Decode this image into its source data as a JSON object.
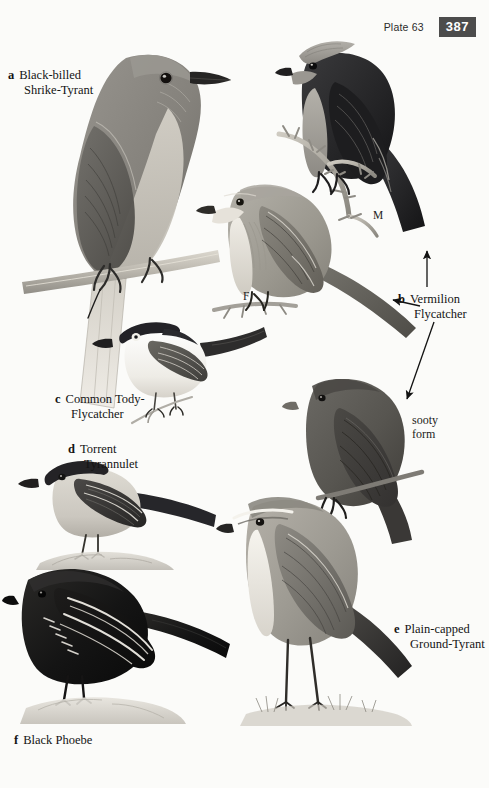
{
  "page": {
    "width": 489,
    "height": 788,
    "background_color": "#fbfbf9",
    "ink_color": "#141414"
  },
  "header": {
    "plate_label": "Plate 63",
    "page_number": "387",
    "page_number_bg": "#4c4c4c",
    "page_number_fg": "#ffffff"
  },
  "captions": [
    {
      "key": "a",
      "line1": "Black-billed",
      "line2": "Shrike-Tyrant",
      "x": 8,
      "y": 68
    },
    {
      "key": "b",
      "line1": "Vermilion",
      "line2": "Flycatcher",
      "x": 398,
      "y": 292
    },
    {
      "key": "c",
      "line1": "Common Tody-",
      "line2": "Flycatcher",
      "x": 55,
      "y": 392
    },
    {
      "key": "d",
      "line1": "Torrent",
      "line2": "Tyrannulet",
      "x": 68,
      "y": 442
    },
    {
      "key": "e",
      "line1": "Plain-capped",
      "line2": "Ground-Tyrant",
      "x": 394,
      "y": 622
    },
    {
      "key": "f",
      "line1": "Black Phoebe",
      "line2": "",
      "x": 14,
      "y": 733
    }
  ],
  "annotations": [
    {
      "name": "sooty-form",
      "line1": "sooty",
      "line2": "form",
      "x": 412,
      "y": 413
    },
    {
      "name": "male-mark",
      "text": "M",
      "x": 373,
      "y": 209
    },
    {
      "name": "female-mark",
      "text": "F",
      "x": 243,
      "y": 290
    }
  ],
  "arrows": [
    {
      "name": "arrow-up-to-male",
      "x1": 427,
      "y1": 287,
      "x2": 427,
      "y2": 250
    },
    {
      "name": "arrow-left-to-female",
      "x1": 418,
      "y1": 305,
      "x2": 392,
      "y2": 300
    },
    {
      "name": "arrow-diagonal-to-sooty",
      "x1": 432,
      "y1": 323,
      "x2": 406,
      "y2": 400
    }
  ],
  "plates": [
    {
      "name": "black-billed-shrike-tyrant",
      "common_name": "Black-billed Shrike-Tyrant",
      "key": "a",
      "pose": "perched on horizontal branch, facing right",
      "plumage": "grey-brown upperparts, pale buff underparts, black bill, long tail",
      "body_color": "#8c8a85",
      "belly_color": "#c9c5bc",
      "wing_color": "#6c6a66",
      "bill_color": "#2a2a2a"
    },
    {
      "name": "vermilion-flycatcher-male",
      "common_name": "Vermilion Flycatcher",
      "key": "b",
      "sex": "M",
      "pose": "perched on thorny branch, facing right",
      "plumage": "crested pale crown, blackish mask, back, wings and tail",
      "body_color": "#2a2a2c",
      "crown_color": "#9e9c97",
      "breast_color": "#a6a39d"
    },
    {
      "name": "vermilion-flycatcher-female",
      "common_name": "Vermilion Flycatcher",
      "key": "b",
      "sex": "F",
      "pose": "perched on small twig, facing left",
      "plumage": "grey-brown above, whitish streaked breast, dark tail",
      "body_color": "#a8a49c",
      "belly_color": "#e2ded6",
      "wing_color": "#7c7a74"
    },
    {
      "name": "vermilion-flycatcher-sooty-form",
      "common_name": "Vermilion Flycatcher",
      "key": "b",
      "form": "sooty form",
      "pose": "perched on twig, facing left",
      "plumage": "uniform dark sooty-grey overall",
      "body_color": "#55534f"
    },
    {
      "name": "common-tody-flycatcher",
      "common_name": "Common Tody-Flycatcher",
      "key": "c",
      "pose": "perched on slender twig, facing left",
      "plumage": "blackish cap, pale eye, white underparts, long dark tail",
      "cap_color": "#27262a",
      "body_color": "#f4f2ee",
      "wing_color": "#54524e"
    },
    {
      "name": "torrent-tyrannulet",
      "common_name": "Torrent Tyrannulet",
      "key": "d",
      "pose": "standing on rock, facing left",
      "plumage": "dark grey cap, pale grey body, blackish wings with pale edges",
      "cap_color": "#2b2a2c",
      "body_color": "#d2cfc8",
      "wing_color": "#3b3a39"
    },
    {
      "name": "plain-capped-ground-tyrant",
      "common_name": "Plain-capped Ground-Tyrant",
      "key": "e",
      "pose": "standing on ground, long legs, facing left",
      "plumage": "pale grey-brown above, whitish below, whitish supercilium, dark tail",
      "body_color": "#a7a49c",
      "belly_color": "#eeebe4",
      "wing_color": "#8a8781"
    },
    {
      "name": "black-phoebe",
      "common_name": "Black Phoebe",
      "key": "f",
      "pose": "perched on rock, facing left",
      "plumage": "sooty black overall with bold white wing edgings",
      "body_color": "#171717",
      "wingbar_color": "#e9e6e0"
    }
  ]
}
